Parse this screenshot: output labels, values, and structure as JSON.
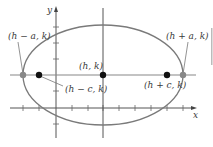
{
  "diagram": {
    "axes": {
      "x_label": "x",
      "y_label": "y"
    },
    "points": [
      {
        "id": "vertex-left",
        "label": "(h − a, k)",
        "kind": "vertex",
        "color": "#888888"
      },
      {
        "id": "focus-left",
        "label": "(h − c, k)",
        "kind": "focus",
        "color": "#111111"
      },
      {
        "id": "center",
        "label": "(h, k)",
        "kind": "center",
        "color": "#111111"
      },
      {
        "id": "focus-right",
        "label": "(h + c, k)",
        "kind": "focus",
        "color": "#111111"
      },
      {
        "id": "vertex-right",
        "label": "(h + a, k)",
        "kind": "vertex",
        "color": "#888888"
      }
    ],
    "colors": {
      "ellipse": "#7a7a7a",
      "axes": "#555555",
      "major_axis": "#888888"
    }
  }
}
